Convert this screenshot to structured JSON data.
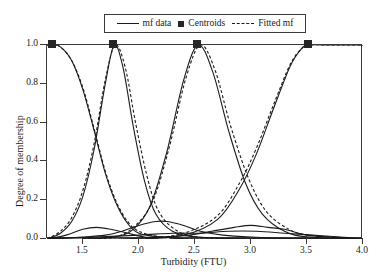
{
  "chart_data": {
    "type": "line",
    "title": "",
    "xlabel": "Turbidity (FTU)",
    "ylabel": "Degree of membership",
    "xlim": [
      1.18,
      4.0
    ],
    "ylim": [
      0.0,
      1.0
    ],
    "xticks": [
      1.5,
      2.0,
      2.5,
      3.0,
      3.5,
      4.0
    ],
    "xticklabels": [
      "1.5",
      "2.0",
      "2.5",
      "3.0",
      "3.5",
      "4.0"
    ],
    "yticks": [
      0.0,
      0.2,
      0.4,
      0.6,
      0.8,
      1.0
    ],
    "yticklabels": [
      "0.0",
      "0.2",
      "0.4",
      "0.6",
      "0.8",
      "1.0"
    ],
    "grid": false,
    "legend_position": "upper center",
    "legend": [
      {
        "label": "mf data",
        "style": "solid-line"
      },
      {
        "label": "Centroids",
        "style": "filled-square-marker"
      },
      {
        "label": "Fitted mf",
        "style": "dashed-line"
      }
    ],
    "centroids": {
      "x": [
        1.23,
        1.78,
        2.53,
        3.52
      ],
      "y": [
        1.0,
        1.0,
        1.0,
        1.0
      ]
    },
    "series": [
      {
        "name": "mf data 1",
        "style": "solid",
        "center": 1.23,
        "width": 0.3,
        "x": [
          1.18,
          1.23,
          1.3,
          1.4,
          1.5,
          1.6,
          1.7,
          1.8,
          1.9,
          2.0,
          2.2,
          2.5,
          3.0,
          3.5,
          4.0
        ],
        "y": [
          1.0,
          1.0,
          0.99,
          0.92,
          0.77,
          0.56,
          0.34,
          0.18,
          0.08,
          0.03,
          0.01,
          0.0,
          0.0,
          0.0,
          0.0
        ]
      },
      {
        "name": "Fitted mf 1",
        "style": "dashed",
        "center": 1.23,
        "width": 0.31,
        "x": [
          1.18,
          1.23,
          1.3,
          1.4,
          1.5,
          1.6,
          1.7,
          1.8,
          1.9,
          2.0,
          2.2,
          2.5,
          3.0,
          3.5,
          4.0
        ],
        "y": [
          1.0,
          1.0,
          0.99,
          0.92,
          0.78,
          0.57,
          0.35,
          0.19,
          0.09,
          0.04,
          0.01,
          0.0,
          0.0,
          0.0,
          0.0
        ]
      },
      {
        "name": "mf data 2",
        "style": "solid",
        "center": 1.78,
        "width": 0.28,
        "x": [
          1.18,
          1.3,
          1.4,
          1.5,
          1.6,
          1.7,
          1.78,
          1.86,
          1.95,
          2.05,
          2.15,
          2.3,
          2.53,
          3.0,
          3.5,
          4.0
        ],
        "y": [
          0.0,
          0.03,
          0.09,
          0.22,
          0.46,
          0.8,
          1.0,
          0.88,
          0.58,
          0.3,
          0.13,
          0.04,
          0.01,
          0.0,
          0.0,
          0.0
        ]
      },
      {
        "name": "Fitted mf 2",
        "style": "dashed",
        "center": 1.79,
        "width": 0.3,
        "x": [
          1.18,
          1.3,
          1.4,
          1.5,
          1.6,
          1.7,
          1.79,
          1.88,
          1.97,
          2.07,
          2.17,
          2.32,
          2.53,
          3.0,
          3.5,
          4.0
        ],
        "y": [
          0.0,
          0.04,
          0.11,
          0.25,
          0.49,
          0.82,
          1.0,
          0.88,
          0.6,
          0.33,
          0.15,
          0.05,
          0.01,
          0.0,
          0.0,
          0.0
        ]
      },
      {
        "name": "mf data 3",
        "style": "solid",
        "center": 2.53,
        "width": 0.34,
        "x": [
          1.5,
          1.78,
          1.95,
          2.1,
          2.25,
          2.4,
          2.53,
          2.66,
          2.8,
          2.95,
          3.1,
          3.3,
          3.52,
          4.0
        ],
        "y": [
          0.0,
          0.01,
          0.05,
          0.17,
          0.45,
          0.82,
          1.0,
          0.86,
          0.56,
          0.29,
          0.13,
          0.04,
          0.01,
          0.0
        ]
      },
      {
        "name": "Fitted mf 3",
        "style": "dashed",
        "center": 2.55,
        "width": 0.36,
        "x": [
          1.5,
          1.78,
          1.95,
          2.12,
          2.27,
          2.42,
          2.55,
          2.68,
          2.82,
          2.98,
          3.14,
          3.34,
          3.52,
          4.0
        ],
        "y": [
          0.0,
          0.01,
          0.06,
          0.19,
          0.47,
          0.83,
          1.0,
          0.87,
          0.58,
          0.31,
          0.14,
          0.05,
          0.02,
          0.0
        ]
      },
      {
        "name": "mf data 4",
        "style": "solid",
        "center": 3.52,
        "width": 0.46,
        "x": [
          1.5,
          2.0,
          2.4,
          2.7,
          2.9,
          3.05,
          3.2,
          3.35,
          3.45,
          3.52,
          3.7,
          3.85,
          4.0
        ],
        "y": [
          0.0,
          0.0,
          0.02,
          0.1,
          0.26,
          0.44,
          0.67,
          0.89,
          0.98,
          1.0,
          1.0,
          1.0,
          1.0
        ]
      },
      {
        "name": "Fitted mf 4",
        "style": "dashed",
        "center": 3.52,
        "width": 0.48,
        "x": [
          1.5,
          2.0,
          2.4,
          2.7,
          2.9,
          3.05,
          3.2,
          3.35,
          3.45,
          3.52,
          3.7,
          3.85,
          4.0
        ],
        "y": [
          0.0,
          0.0,
          0.03,
          0.12,
          0.29,
          0.47,
          0.69,
          0.9,
          0.98,
          1.0,
          1.0,
          1.0,
          1.0
        ]
      },
      {
        "name": "secondary lobe A",
        "style": "solid",
        "x": [
          1.18,
          1.35,
          1.5,
          1.62,
          1.75,
          1.9,
          2.05,
          2.2,
          2.4,
          2.6,
          3.0,
          3.5,
          4.0
        ],
        "y": [
          0.0,
          0.02,
          0.05,
          0.06,
          0.05,
          0.03,
          0.01,
          0.01,
          0.0,
          0.0,
          0.0,
          0.0,
          0.0
        ]
      },
      {
        "name": "secondary lobe B",
        "style": "solid",
        "x": [
          1.18,
          1.5,
          1.7,
          1.85,
          2.0,
          2.15,
          2.25,
          2.4,
          2.55,
          2.75,
          3.0,
          3.5,
          4.0
        ],
        "y": [
          0.0,
          0.01,
          0.02,
          0.04,
          0.07,
          0.09,
          0.09,
          0.07,
          0.04,
          0.02,
          0.01,
          0.0,
          0.0
        ]
      },
      {
        "name": "secondary lobe C",
        "style": "solid",
        "x": [
          1.18,
          1.8,
          2.2,
          2.45,
          2.65,
          2.85,
          3.0,
          3.15,
          3.3,
          3.5,
          3.7,
          4.0
        ],
        "y": [
          0.0,
          0.0,
          0.01,
          0.02,
          0.04,
          0.06,
          0.07,
          0.06,
          0.05,
          0.02,
          0.01,
          0.0
        ]
      },
      {
        "name": "secondary lobe D",
        "style": "solid",
        "x": [
          1.18,
          1.6,
          2.0,
          2.3,
          2.55,
          2.8,
          3.05,
          3.3,
          3.55,
          3.8,
          4.0
        ],
        "y": [
          0.0,
          0.01,
          0.02,
          0.03,
          0.03,
          0.04,
          0.04,
          0.03,
          0.02,
          0.01,
          0.0
        ]
      }
    ]
  }
}
